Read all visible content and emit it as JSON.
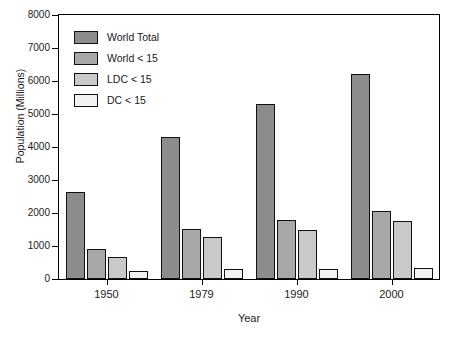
{
  "chart_data": {
    "type": "bar",
    "title": "",
    "xlabel": "Year",
    "ylabel": "Population (Millions)",
    "categories": [
      "1950",
      "1979",
      "1990",
      "2000"
    ],
    "series": [
      {
        "name": "World Total",
        "color": "#8c8c8c",
        "values": [
          2650,
          4300,
          5300,
          6200
        ]
      },
      {
        "name": "World < 15",
        "color": "#a8a8a8",
        "values": [
          900,
          1530,
          1780,
          2060
        ]
      },
      {
        "name": "LDC < 15",
        "color": "#c9c9c9",
        "values": [
          680,
          1260,
          1500,
          1760
        ]
      },
      {
        "name": "DC < 15",
        "color": "#f2f2f2",
        "values": [
          240,
          290,
          290,
          330
        ]
      }
    ],
    "ylim": [
      0,
      8000
    ],
    "yticks": [
      "0",
      "1000",
      "2000",
      "3000",
      "4000",
      "5000",
      "6000",
      "7000",
      "8000"
    ],
    "grid": false,
    "legend_position": "top-left"
  },
  "axes": {
    "y_title": "Population (Millions)",
    "x_title": "Year"
  }
}
